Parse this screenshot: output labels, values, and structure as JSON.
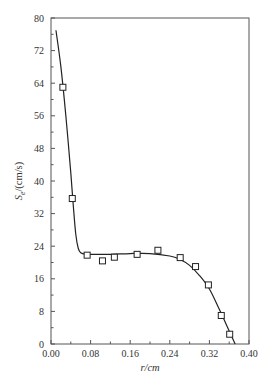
{
  "chart_data": {
    "type": "scatter",
    "title": "",
    "xlabel": "r/cm",
    "ylabel": "S_e/(cm/s)",
    "xlim": [
      0.0,
      0.4
    ],
    "ylim": [
      0,
      80
    ],
    "x_ticks": [
      "0.00",
      "0.08",
      "0.16",
      "0.24",
      "0.32",
      "0.40"
    ],
    "y_ticks": [
      "0",
      "8",
      "16",
      "24",
      "32",
      "40",
      "48",
      "56",
      "64",
      "72",
      "80"
    ],
    "grid": false,
    "legend": null,
    "series": [
      {
        "name": "measured",
        "marker": "open-square",
        "x": [
          0.024,
          0.043,
          0.073,
          0.104,
          0.128,
          0.174,
          0.216,
          0.261,
          0.292,
          0.318,
          0.344,
          0.361
        ],
        "y": [
          63.0,
          35.7,
          21.8,
          20.4,
          21.3,
          22.0,
          23.0,
          21.2,
          19.0,
          14.5,
          7.0,
          2.4
        ]
      },
      {
        "name": "fit curve",
        "marker": "line",
        "x": [
          0.01,
          0.02,
          0.03,
          0.04,
          0.045,
          0.05,
          0.055,
          0.06,
          0.07,
          0.08,
          0.12,
          0.16,
          0.2,
          0.24,
          0.26,
          0.28,
          0.3,
          0.32,
          0.34,
          0.36,
          0.372
        ],
        "y": [
          77.0,
          68.0,
          56.0,
          42.0,
          34.0,
          27.0,
          23.5,
          22.4,
          22.0,
          22.0,
          22.0,
          22.2,
          22.2,
          21.6,
          20.8,
          19.3,
          16.8,
          13.5,
          8.5,
          3.2,
          0.0
        ]
      }
    ]
  },
  "caption": ""
}
